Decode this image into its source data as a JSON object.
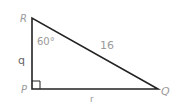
{
  "figure": {
    "type": "right-triangle",
    "vertices": {
      "R": {
        "label": "R",
        "x": 32,
        "y": 18
      },
      "P": {
        "label": "P",
        "x": 32,
        "y": 89
      },
      "Q": {
        "label": "Q",
        "x": 158,
        "y": 89
      }
    },
    "angle_R": "60°",
    "right_angle_at": "P",
    "sides": {
      "hypotenuse_RQ": "16",
      "side_RP": "q",
      "side_PQ": "r"
    },
    "colors": {
      "line": "#222222",
      "label": "#9a9a9a"
    }
  }
}
